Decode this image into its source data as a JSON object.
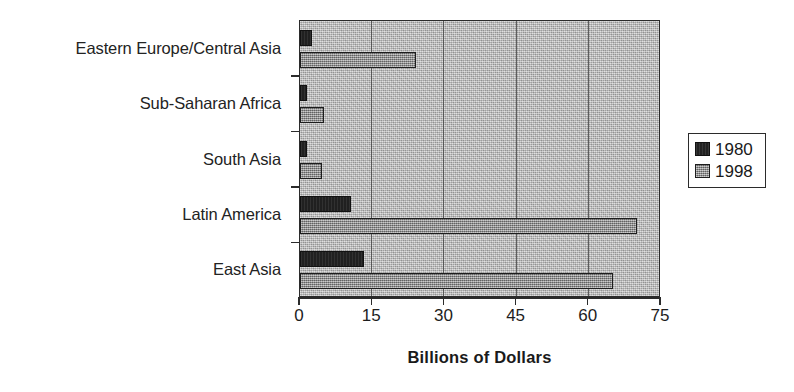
{
  "chart_data": {
    "type": "bar",
    "orientation": "horizontal",
    "title": "",
    "xlabel": "Billions of Dollars",
    "ylabel": "",
    "xlim": [
      0,
      75
    ],
    "xticks": [
      0,
      15,
      30,
      45,
      60,
      75
    ],
    "xtick_labels": [
      "0",
      "15",
      "30",
      "45",
      "60",
      "75"
    ],
    "grid": true,
    "grid_axis": "x",
    "legend_position": "right",
    "categories": [
      "Eastern Europe/Central Asia",
      "Sub-Saharan Africa",
      "South Asia",
      "Latin America",
      "East Asia"
    ],
    "series": [
      {
        "name": "1980",
        "color": "#262626",
        "values": [
          2.5,
          1.5,
          1.5,
          10.5,
          13.3
        ]
      },
      {
        "name": "1998",
        "color": "#9c9c9c",
        "values": [
          24,
          5,
          4.5,
          70,
          65
        ]
      }
    ]
  },
  "legend": {
    "entries": [
      {
        "label": "1980",
        "swatch": "dark-square-swatch"
      },
      {
        "label": "1998",
        "swatch": "light-square-swatch"
      }
    ]
  },
  "axis": {
    "x_title": "Billions of Dollars",
    "tick_labels": [
      "0",
      "15",
      "30",
      "45",
      "60",
      "75"
    ]
  },
  "categories": [
    "Eastern Europe/Central Asia",
    "Sub-Saharan Africa",
    "South Asia",
    "Latin America",
    "East Asia"
  ]
}
